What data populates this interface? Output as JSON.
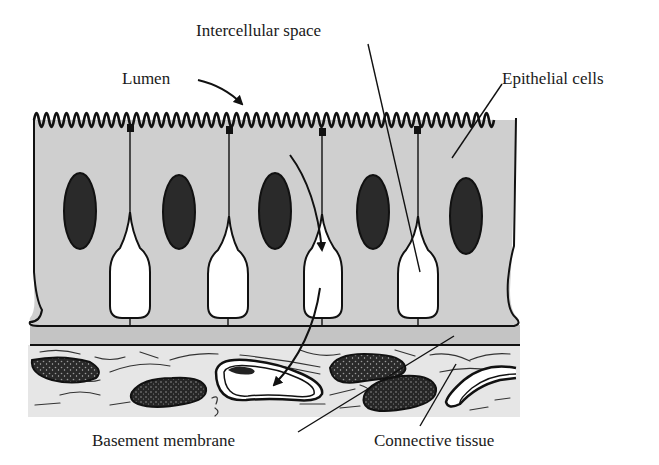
{
  "figure": {
    "type": "histology-diagram",
    "colors": {
      "cells": "#cfcfcf",
      "basement_membrane": "#c4c4c4",
      "connective_tissue": "#e6e6e6",
      "nucleus": "#2a2a2a",
      "ink": "#111111",
      "intercellular_space": "#ffffff"
    },
    "cell_count": 5
  },
  "labels": {
    "intercellular_space": "Intercellular space",
    "lumen": "Lumen",
    "epithelial_cells": "Epithelial cells",
    "basement_membrane": "Basement membrane",
    "connective_tissue": "Connective tissue"
  }
}
